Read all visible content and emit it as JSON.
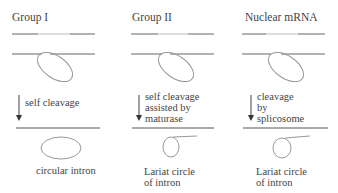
{
  "columns": [
    {
      "title": "Group I",
      "step_label": [
        "self cleavage"
      ],
      "product_label": [
        "circular intron"
      ]
    },
    {
      "title": "Group II",
      "step_label": [
        "self cleavage",
        "assisted by",
        "maturase"
      ],
      "product_label": [
        "Lariat circle",
        "of intron"
      ]
    },
    {
      "title": "Nuclear mRNA",
      "step_label": [
        "cleavage",
        "by",
        "splicosome"
      ],
      "product_label": [
        "Lariat circle",
        "of intron"
      ]
    }
  ],
  "colors": {
    "line": "#555555",
    "intron_segment": "#bbbbbb",
    "loop": "#888888",
    "text": "#444444"
  }
}
